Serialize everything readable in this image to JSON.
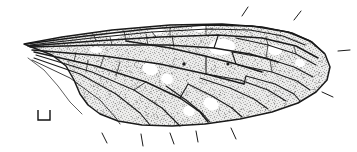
{
  "figure": {
    "kind": "scientific-illustration",
    "title": "",
    "caption": "",
    "background_color": "#ffffff",
    "ink_color": "#1a1a1a",
    "membrane_fill": "#ececeb",
    "membrane_stipple_color": "#3a3a3a",
    "pale_cell_color": "#ffffff",
    "width_px": 357,
    "height_px": 152
  },
  "wing": {
    "name": "wing-outline",
    "orientation": "base-left-apex-right",
    "outline_path": "M 24,44 L 62,37 L 112,30 L 170,25 L 222,24 L 262,27 L 292,33 L 312,42 L 325,54 L 330,67 L 327,80 L 316,92 L 298,103 L 272,112 L 240,119 L 205,124 L 172,126 L 142,125 L 118,121 L 100,114 L 88,105 L 80,94 L 74,80 L 66,66 L 52,55 L 34,48 Z",
    "costal_margin_path": "M 24,44 L 80,36 L 140,29 L 200,25 L 248,26 L 284,31 L 308,40 L 323,52",
    "apex_path": "M 323,52 L 330,66 L 326,80 L 314,92",
    "posterior_margin_path": "M 314,92 L 288,105 L 252,115 L 212,122 L 176,126 L 144,125 L 119,121 L 100,113 L 86,102 L 76,88 L 68,72 L 56,59 L 40,50 L 24,44",
    "base_detail_path": "M 24,44 L 40,46 L 58,48 L 76,52"
  },
  "veins": [
    {
      "name": "costa",
      "weight": "major",
      "path": "M 26,44 L 86,36 L 148,29 L 206,25 L 252,26 L 288,32 L 310,41 L 324,53"
    },
    {
      "name": "subcosta",
      "weight": "mid",
      "path": "M 30,45 L 92,38 L 152,32 L 208,29 L 250,30 L 283,36 L 305,45"
    },
    {
      "name": "radius-R1",
      "weight": "major",
      "path": "M 28,46 L 95,41 L 160,37 L 218,35 L 262,38 L 296,46 L 318,58"
    },
    {
      "name": "radius-stem",
      "weight": "major",
      "path": "M 30,47 L 100,45 L 168,45 L 214,48 L 250,54 L 278,62"
    },
    {
      "name": "radial-sector-Rs",
      "weight": "major",
      "path": "M 126,41 L 170,48 L 205,56 L 236,64 L 262,72"
    },
    {
      "name": "R2",
      "weight": "mid",
      "path": "M 236,38 L 268,45 L 296,54 L 316,65"
    },
    {
      "name": "R3",
      "weight": "mid",
      "path": "M 232,52 L 266,58 L 294,67 L 313,77"
    },
    {
      "name": "R4",
      "weight": "mid",
      "path": "M 238,65 L 272,72 L 297,81 L 310,90"
    },
    {
      "name": "R5",
      "weight": "mid",
      "path": "M 246,76 L 275,84 L 294,94 L 300,101"
    },
    {
      "name": "media-stem",
      "weight": "major",
      "path": "M 32,50 L 104,56 L 160,64 L 206,74 L 244,84"
    },
    {
      "name": "M1",
      "weight": "mid",
      "path": "M 206,74 L 240,80 L 268,90 L 286,101"
    },
    {
      "name": "M2",
      "weight": "mid",
      "path": "M 200,78 L 230,88 L 254,99 L 268,109"
    },
    {
      "name": "M3",
      "weight": "mid",
      "path": "M 188,84 L 212,96 L 232,108 L 242,117"
    },
    {
      "name": "M4",
      "weight": "mid",
      "path": "M 166,86 L 186,100 L 202,113 L 210,122"
    },
    {
      "name": "cubitus-Cu1",
      "weight": "major",
      "path": "M 34,52 L 96,66 L 146,82 L 180,98 L 200,112 L 208,122"
    },
    {
      "name": "cubitus-Cu2",
      "weight": "mid",
      "path": "M 36,55 L 92,72 L 134,90 L 162,108 L 176,122 L 180,126"
    },
    {
      "name": "anal-A1",
      "weight": "mid",
      "path": "M 34,58 L 80,74 L 116,94 L 140,113 L 150,125"
    },
    {
      "name": "anal-A2",
      "weight": "minor",
      "path": "M 32,60 L 70,78 L 100,100 L 116,118 L 120,124"
    },
    {
      "name": "axillary-basal",
      "weight": "fine",
      "path": "M 28,58 L 44,70 L 58,86 L 70,102 L 82,114"
    },
    {
      "name": "crossvein-sc-r",
      "weight": "minor",
      "path": "M 152,32 L 156,37"
    },
    {
      "name": "crossvein-r-rs",
      "weight": "minor",
      "path": "M 172,36 L 174,47"
    },
    {
      "name": "crossvein-r-m-discal-top",
      "weight": "mid",
      "path": "M 214,48 L 218,36"
    },
    {
      "name": "crossvein-rs-m",
      "weight": "mid",
      "path": "M 236,64 L 232,52"
    },
    {
      "name": "crossvein-m-discal-left",
      "weight": "mid",
      "path": "M 206,56 L 206,74"
    },
    {
      "name": "crossvein-m-discal-right",
      "weight": "mid",
      "path": "M 244,84 L 246,76"
    },
    {
      "name": "crossvein-m-cu",
      "weight": "mid",
      "path": "M 180,98 L 188,84"
    },
    {
      "name": "crossvein-cu-a",
      "weight": "minor",
      "path": "M 134,90 L 146,82"
    },
    {
      "name": "crossvein-costal-1",
      "weight": "fine",
      "path": "M 96,41 L 94,35"
    },
    {
      "name": "crossvein-costal-2",
      "weight": "fine",
      "path": "M 126,41 L 124,31"
    },
    {
      "name": "crossvein-costal-3",
      "weight": "fine",
      "path": "M 170,37 L 170,27"
    },
    {
      "name": "crossvein-costal-4",
      "weight": "fine",
      "path": "M 206,35 L 206,25"
    },
    {
      "name": "crossvein-cell-div-1",
      "weight": "fine",
      "path": "M 112,45 L 110,37"
    },
    {
      "name": "crossvein-cell-div-2",
      "weight": "fine",
      "path": "M 148,45 L 146,34"
    },
    {
      "name": "crossvein-cell-div-3",
      "weight": "fine",
      "path": "M 268,45 L 266,37"
    },
    {
      "name": "crossvein-cell-div-4",
      "weight": "fine",
      "path": "M 296,54 L 294,46"
    },
    {
      "name": "crossvein-cell-div-5",
      "weight": "fine",
      "path": "M 266,58 L 268,45"
    },
    {
      "name": "crossvein-cell-div-6",
      "weight": "fine",
      "path": "M 272,72 L 270,60"
    },
    {
      "name": "crossvein-anal-1",
      "weight": "fine",
      "path": "M 104,56 L 100,68"
    },
    {
      "name": "crossvein-anal-2",
      "weight": "fine",
      "path": "M 120,62 L 116,76"
    },
    {
      "name": "crossvein-basal-1",
      "weight": "fine",
      "path": "M 76,52 L 74,62"
    },
    {
      "name": "crossvein-basal-2",
      "weight": "fine",
      "path": "M 88,60 L 86,72"
    }
  ],
  "pale_cells": [
    {
      "name": "pale-cell-stigma",
      "cx": 222,
      "cy": 47,
      "rx": 13,
      "ry": 8,
      "rot": -6
    },
    {
      "name": "pale-cell-costal-1",
      "cx": 114,
      "cy": 35,
      "rx": 7,
      "ry": 4,
      "rot": -7
    },
    {
      "name": "pale-cell-costal-2",
      "cx": 156,
      "cy": 31,
      "rx": 7,
      "ry": 4,
      "rot": -5
    },
    {
      "name": "pale-cell-costal-3",
      "cx": 199,
      "cy": 28,
      "rx": 7,
      "ry": 4,
      "rot": -2
    },
    {
      "name": "pale-cell-mid-1",
      "cx": 275,
      "cy": 50,
      "rx": 7,
      "ry": 5,
      "rot": 12
    },
    {
      "name": "pale-cell-mid-2",
      "cx": 150,
      "cy": 69,
      "rx": 8,
      "ry": 6,
      "rot": 20
    },
    {
      "name": "pale-cell-mid-3",
      "cx": 167,
      "cy": 79,
      "rx": 6,
      "ry": 5,
      "rot": 25
    },
    {
      "name": "pale-cell-lower-1",
      "cx": 211,
      "cy": 104,
      "rx": 8,
      "ry": 6,
      "rot": 28
    },
    {
      "name": "pale-cell-lower-2",
      "cx": 189,
      "cy": 111,
      "rx": 6,
      "ry": 5,
      "rot": 30
    },
    {
      "name": "pale-cell-apex-1",
      "cx": 300,
      "cy": 63,
      "rx": 5,
      "ry": 4,
      "rot": 15
    },
    {
      "name": "pale-cell-base-1",
      "cx": 96,
      "cy": 50,
      "rx": 6,
      "ry": 3,
      "rot": -3
    }
  ],
  "wing_dots": [
    {
      "name": "wing-dot-left",
      "cx": 184,
      "cy": 64,
      "r": 1.7
    },
    {
      "name": "wing-dot-right",
      "cx": 228,
      "cy": 64,
      "r": 1.5
    }
  ],
  "margin_ticks": [
    {
      "name": "margin-tick-top-1",
      "path": "M 242,16 L 248,7"
    },
    {
      "name": "margin-tick-top-2",
      "path": "M 294,20 L 301,11"
    },
    {
      "name": "margin-tick-apex-right",
      "path": "M 338,51 L 350,50"
    },
    {
      "name": "margin-tick-apex-lower",
      "path": "M 322,92 L 333,97"
    },
    {
      "name": "margin-tick-bottom-1",
      "path": "M 102,133 L 107,143"
    },
    {
      "name": "margin-tick-bottom-2",
      "path": "M 141,134 L 143,146"
    },
    {
      "name": "margin-tick-bottom-3",
      "path": "M 170,133 L 174,144"
    },
    {
      "name": "margin-tick-bottom-4",
      "path": "M 196,131 L 198,142"
    },
    {
      "name": "margin-tick-bottom-5",
      "path": "M 231,128 L 236,139"
    }
  ],
  "scale_bar": {
    "name": "scale-bracket",
    "label": "",
    "path": "M 38,110 L 38,120 L 50,120 L 50,110",
    "x": 38,
    "y": 110,
    "width": 12,
    "height": 10
  },
  "stipple": {
    "name": "membrane-stipple",
    "dot_radius": 0.42,
    "density": 0.3,
    "seed": 20240617
  }
}
